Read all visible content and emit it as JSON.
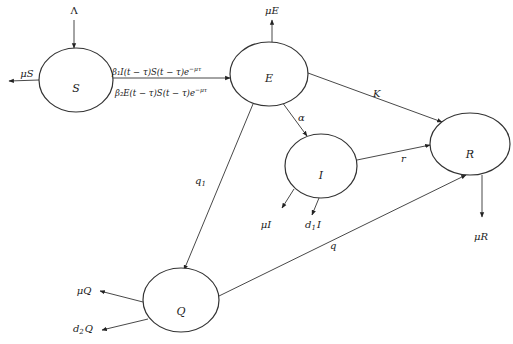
{
  "diagram": {
    "nodes": [
      {
        "id": "S",
        "label": "S",
        "cx": 76,
        "cy": 80,
        "rx": 37,
        "ry": 32
      },
      {
        "id": "E",
        "label": "E",
        "cx": 269,
        "cy": 74,
        "rx": 39,
        "ry": 32
      },
      {
        "id": "I",
        "label": "I",
        "cx": 321,
        "cy": 166,
        "rx": 36,
        "ry": 32
      },
      {
        "id": "R",
        "label": "R",
        "cx": 470,
        "cy": 144,
        "rx": 40,
        "ry": 31
      },
      {
        "id": "Q",
        "label": "Q",
        "cx": 181,
        "cy": 300,
        "rx": 38,
        "ry": 32
      }
    ],
    "transitions": {
      "inflow_S": "Λ",
      "S_to_E_1": "β₁I(t − τ)S(t − τ)e",
      "S_to_E_1_exp": "−μτ",
      "S_to_E_2": "β₂E(t − τ)S(t − τ)e",
      "S_to_E_2_exp": "−μτ",
      "E_to_I": "α",
      "E_to_R": "K",
      "E_to_Q": "q",
      "E_to_Q_sub": "1",
      "I_to_R": "r",
      "Q_to_R": "q"
    },
    "outflows": {
      "S_death": "μS",
      "E_death": "μE",
      "I_death": "μI",
      "I_disease_death": "d",
      "I_disease_death_sub": "1",
      "I_disease_death_var": "I",
      "R_death": "μR",
      "Q_death": "μQ",
      "Q_disease_death": "d",
      "Q_disease_death_sub": "2",
      "Q_disease_death_var": "Q"
    },
    "colors": {
      "stroke": "#333333",
      "text": "#222222",
      "background": "#ffffff"
    }
  }
}
